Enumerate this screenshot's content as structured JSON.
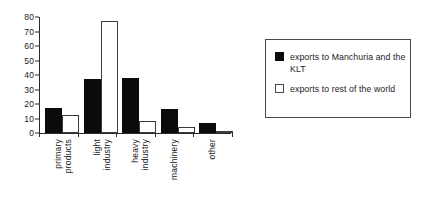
{
  "chart_data": {
    "type": "bar",
    "title": "",
    "subtitle": "",
    "xlabel": "",
    "ylabel": "",
    "ylim": [
      0,
      80
    ],
    "yticks": [
      0,
      10,
      20,
      30,
      40,
      50,
      60,
      70,
      80
    ],
    "ytick_labels": [
      "0",
      "10",
      "20",
      "30",
      "40",
      "50",
      "60",
      "70",
      "80"
    ],
    "grid": false,
    "legend_position": "right",
    "categories": [
      "primary products",
      "light industry",
      "heavy industry",
      "machinery",
      "other"
    ],
    "category_lines": [
      [
        "primary",
        "products"
      ],
      [
        "light",
        "industry"
      ],
      [
        "heavy",
        "industry"
      ],
      [
        "machinery",
        ""
      ],
      [
        "other",
        ""
      ]
    ],
    "series": [
      {
        "name": "exports to Manchuria and the KLT",
        "color": "#0b0b0b",
        "fill": "solid",
        "values": [
          17,
          37,
          38,
          16.5,
          7
        ]
      },
      {
        "name": "exports to rest of the world",
        "color": "#ffffff",
        "fill": "open",
        "values": [
          12.5,
          77,
          8,
          4,
          0.5
        ]
      }
    ]
  },
  "legend": {
    "entries": [
      {
        "label": "exports to Manchuria and the KLT",
        "swatch": "black-square-icon"
      },
      {
        "label": "exports to rest of the world",
        "swatch": "white-square-icon"
      }
    ]
  },
  "colors": {
    "series_1": "#0b0b0b",
    "series_2": "#ffffff",
    "axis": "#2a2a2a",
    "text": "#1a1a1a",
    "background": "#ffffff",
    "legend_border": "#4a4a4a"
  }
}
